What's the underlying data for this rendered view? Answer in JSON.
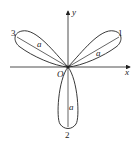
{
  "figure": {
    "type": "three-leaved rose",
    "axes": {
      "x_label": "x",
      "y_label": "y",
      "origin_label": "O"
    },
    "petals": [
      {
        "id": "1",
        "label": "1",
        "length_label": "a"
      },
      {
        "id": "2",
        "label": "2",
        "length_label": "a"
      },
      {
        "id": "3",
        "label": "3",
        "length_label": "a"
      }
    ],
    "colors": {
      "stroke": "#222222",
      "background": "#ffffff"
    }
  }
}
